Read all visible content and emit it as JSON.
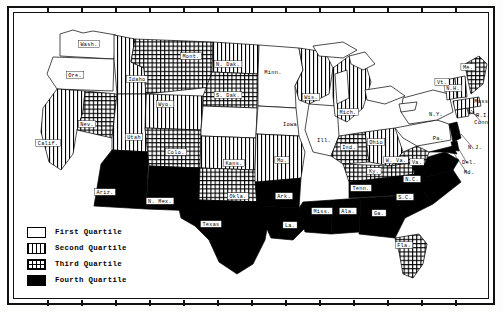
{
  "figure": {
    "type": "choropleth-map",
    "region": "United States",
    "border_style": "double-rule frame with tick marks"
  },
  "legend": {
    "name": "quartile-legend",
    "items": [
      {
        "key": "q1",
        "label": "First Quartile",
        "pattern": "white",
        "color": "#ffffff"
      },
      {
        "key": "q2",
        "label": "Second Quartile",
        "pattern": "vertical",
        "color": "#000000"
      },
      {
        "key": "q3",
        "label": "Third Quartile",
        "pattern": "crosshatch",
        "color": "#000000"
      },
      {
        "key": "q4",
        "label": "Fourth Quartile",
        "pattern": "solid",
        "color": "#000000"
      }
    ]
  },
  "chart_data": {
    "type": "map",
    "title": "",
    "legend_position": "bottom-left",
    "categories": [
      "First Quartile",
      "Second Quartile",
      "Third Quartile",
      "Fourth Quartile"
    ],
    "states": [
      {
        "label": "Wash.",
        "quartile": 1
      },
      {
        "label": "Ore.",
        "quartile": 1
      },
      {
        "label": "Idaho",
        "quartile": 2
      },
      {
        "label": "Mont.",
        "quartile": 3
      },
      {
        "label": "Wyo.",
        "quartile": 2
      },
      {
        "label": "Calif.",
        "quartile": 2
      },
      {
        "label": "Nev.",
        "quartile": 3
      },
      {
        "label": "Utah",
        "quartile": 2
      },
      {
        "label": "Ariz.",
        "quartile": 4
      },
      {
        "label": "Colo.",
        "quartile": 3
      },
      {
        "label": "N. Mex.",
        "quartile": 4
      },
      {
        "label": "N. Dak.",
        "quartile": 2
      },
      {
        "label": "S. Dak.",
        "quartile": 3
      },
      {
        "label": "Nebr.",
        "quartile": 1
      },
      {
        "label": "Kans.",
        "quartile": 2
      },
      {
        "label": "Okla.",
        "quartile": 3
      },
      {
        "label": "Texas",
        "quartile": 4
      },
      {
        "label": "Minn.",
        "quartile": 1
      },
      {
        "label": "Iowa",
        "quartile": 1
      },
      {
        "label": "Mo.",
        "quartile": 2
      },
      {
        "label": "Ark.",
        "quartile": 4
      },
      {
        "label": "La.",
        "quartile": 4
      },
      {
        "label": "Wis.",
        "quartile": 2
      },
      {
        "label": "Ill.",
        "quartile": 1
      },
      {
        "label": "Mich.",
        "quartile": 2
      },
      {
        "label": "Ind.",
        "quartile": 3
      },
      {
        "label": "Ohio",
        "quartile": 2
      },
      {
        "label": "Ky.",
        "quartile": 3
      },
      {
        "label": "Tenn.",
        "quartile": 4
      },
      {
        "label": "Miss.",
        "quartile": 4
      },
      {
        "label": "Ala.",
        "quartile": 4
      },
      {
        "label": "Ga.",
        "quartile": 4
      },
      {
        "label": "Fla.",
        "quartile": 3
      },
      {
        "label": "S.C.",
        "quartile": 4
      },
      {
        "label": "N.C.",
        "quartile": 4
      },
      {
        "label": "Va.",
        "quartile": 4
      },
      {
        "label": "W. Va.",
        "quartile": 3
      },
      {
        "label": "Md.",
        "quartile": 4
      },
      {
        "label": "Del.",
        "quartile": 4
      },
      {
        "label": "Pa.",
        "quartile": 1
      },
      {
        "label": "N.Y.",
        "quartile": 1
      },
      {
        "label": "N.J.",
        "quartile": 4
      },
      {
        "label": "Conn.",
        "quartile": 2
      },
      {
        "label": "R.I.",
        "quartile": 2
      },
      {
        "label": "Mass.",
        "quartile": 2
      },
      {
        "label": "Vt.",
        "quartile": 2
      },
      {
        "label": "N.H.",
        "quartile": 2
      },
      {
        "label": "Me.",
        "quartile": 3
      }
    ]
  },
  "map_labels": {
    "boxed": [
      {
        "text": "Wash.",
        "x": 76,
        "y": 32
      },
      {
        "text": "Ore.",
        "x": 62,
        "y": 63
      },
      {
        "text": "Idaho",
        "x": 124,
        "y": 67
      },
      {
        "text": "Mont.",
        "x": 178,
        "y": 44
      },
      {
        "text": "Wyo.",
        "x": 152,
        "y": 92
      },
      {
        "text": "Calif.",
        "x": 35,
        "y": 131
      },
      {
        "text": "Nev.",
        "x": 74,
        "y": 112
      },
      {
        "text": "Utah",
        "x": 121,
        "y": 125
      },
      {
        "text": "Ariz.",
        "x": 92,
        "y": 180
      },
      {
        "text": "Colo.",
        "x": 163,
        "y": 140
      },
      {
        "text": "N. Mex.",
        "x": 147,
        "y": 189
      },
      {
        "text": "N. Dak.",
        "x": 215,
        "y": 52
      },
      {
        "text": "S. Dak.",
        "x": 215,
        "y": 83
      },
      {
        "text": "Kans.",
        "x": 221,
        "y": 151
      },
      {
        "text": "Okla.",
        "x": 225,
        "y": 184
      },
      {
        "text": "Texas",
        "x": 198,
        "y": 212
      },
      {
        "text": "Mo.",
        "x": 269,
        "y": 148
      },
      {
        "text": "Ark.",
        "x": 271,
        "y": 184
      },
      {
        "text": "La.",
        "x": 277,
        "y": 213
      },
      {
        "text": "Wis.",
        "x": 298,
        "y": 85
      },
      {
        "text": "Mich.",
        "x": 335,
        "y": 100
      },
      {
        "text": "Ind.",
        "x": 336,
        "y": 135
      },
      {
        "text": "Ohio",
        "x": 363,
        "y": 130
      },
      {
        "text": "Ky.",
        "x": 361,
        "y": 159
      },
      {
        "text": "Tenn.",
        "x": 348,
        "y": 176
      },
      {
        "text": "Miss.",
        "x": 309,
        "y": 199
      },
      {
        "text": "Ala.",
        "x": 335,
        "y": 199
      },
      {
        "text": "Ga.",
        "x": 366,
        "y": 201
      },
      {
        "text": "Fla.",
        "x": 391,
        "y": 233
      },
      {
        "text": "S.C.",
        "x": 392,
        "y": 185
      },
      {
        "text": "N.C.",
        "x": 399,
        "y": 167
      },
      {
        "text": "Va.",
        "x": 404,
        "y": 150
      },
      {
        "text": "W. Va.",
        "x": 383,
        "y": 148
      },
      {
        "text": "Me.",
        "x": 455,
        "y": 55
      },
      {
        "text": "N.H.",
        "x": 440,
        "y": 76
      },
      {
        "text": "Vt.",
        "x": 429,
        "y": 70
      }
    ],
    "plain": [
      {
        "text": "Minn.",
        "x": 260,
        "y": 62
      },
      {
        "text": "Iowa",
        "x": 277,
        "y": 114
      },
      {
        "text": "Ill.",
        "x": 311,
        "y": 130
      },
      {
        "text": "N.Y.",
        "x": 423,
        "y": 104
      },
      {
        "text": "Pa.",
        "x": 425,
        "y": 128
      },
      {
        "text": "Mass.",
        "x": 470,
        "y": 91
      },
      {
        "text": "R.I.",
        "x": 470,
        "y": 105
      },
      {
        "text": "Conn.",
        "x": 470,
        "y": 112
      },
      {
        "text": "N.J.",
        "x": 462,
        "y": 137
      },
      {
        "text": "Del.",
        "x": 456,
        "y": 152
      },
      {
        "text": "Md.",
        "x": 456,
        "y": 162
      }
    ]
  }
}
